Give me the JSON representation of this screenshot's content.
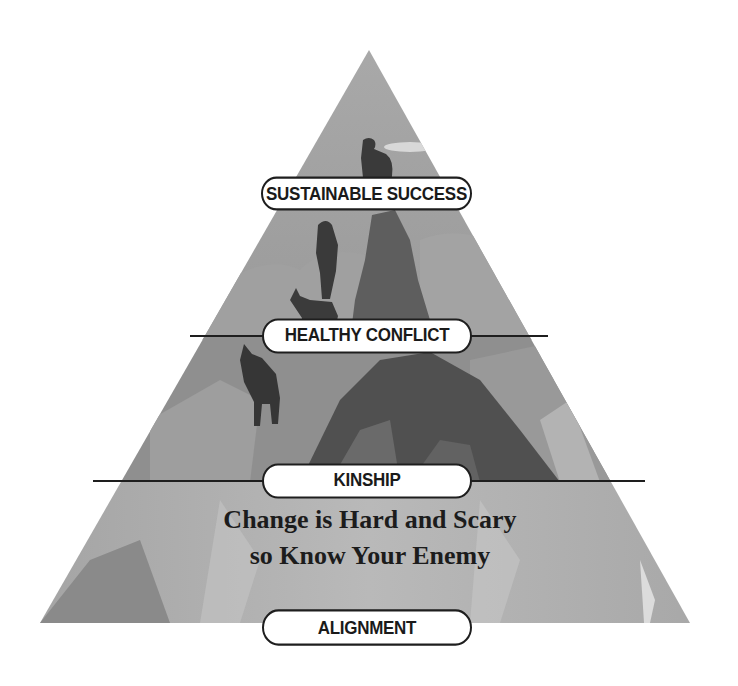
{
  "diagram": {
    "type": "pyramid",
    "levels_top_to_bottom": [
      {
        "label": "SUSTAINABLE SUCCESS"
      },
      {
        "label": "HEALTHY CONFLICT"
      },
      {
        "label": "KINSHIP"
      },
      {
        "label": "ALIGNMENT"
      }
    ],
    "tagline": {
      "line1": "Change is Hard and Scary",
      "line2": "so Know Your Enemy"
    },
    "illustration": "mountain climbers with dogs ascending rocky peak (grayscale)",
    "colors": {
      "background": "#ffffff",
      "pyramid_light": "#b8b8b8",
      "pyramid_mid": "#8e8e8e",
      "pyramid_dark": "#555555",
      "silhouette": "#3a3a3a",
      "divider": "#1e1e1e",
      "pill_fill": "#ffffff",
      "pill_border": "#1e1e1e",
      "text": "#1a1a1a"
    }
  }
}
